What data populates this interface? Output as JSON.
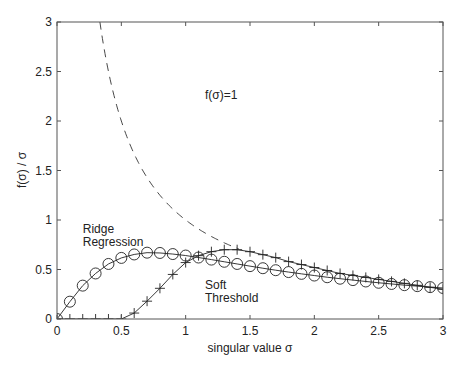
{
  "chart_data": {
    "type": "line",
    "title": "",
    "xlabel": "singular value σ",
    "ylabel": "f(σ) / σ",
    "xlim": [
      0,
      3
    ],
    "ylim": [
      0,
      3
    ],
    "xticks": [
      0,
      0.5,
      1,
      1.5,
      2,
      2.5,
      3
    ],
    "xtick_labels": [
      "0",
      "0.5",
      "1",
      "1.5",
      "2",
      "2.5",
      "3"
    ],
    "yticks": [
      0,
      0.5,
      1,
      1.5,
      2,
      2.5,
      3
    ],
    "ytick_labels": [
      "0",
      "0.5",
      "1",
      "1.5",
      "2",
      "2.5",
      "3"
    ],
    "grid": false,
    "legend": "none (inline annotations)",
    "annotations": [
      {
        "text": "f(σ)=1",
        "x": 1.15,
        "y": 2.22
      },
      {
        "text": "Ridge",
        "x": 0.2,
        "y": 0.87
      },
      {
        "text": "Regression",
        "x": 0.2,
        "y": 0.74
      },
      {
        "text": "Soft",
        "x": 1.15,
        "y": 0.3
      },
      {
        "text": "Threshold",
        "x": 1.15,
        "y": 0.17
      }
    ],
    "series": [
      {
        "name": "f(σ)=1",
        "style": "dashed",
        "marker": "none",
        "x": [
          0.333,
          0.4,
          0.5,
          0.6,
          0.7,
          0.8,
          0.9,
          1.0,
          1.1,
          1.2,
          1.3,
          1.4
        ],
        "values": [
          3.0,
          2.5,
          2.0,
          1.667,
          1.429,
          1.25,
          1.111,
          1.0,
          0.909,
          0.833,
          0.769,
          0.714
        ]
      },
      {
        "name": "Ridge Regression",
        "style": "solid",
        "marker": "circle",
        "x": [
          0,
          0.1,
          0.2,
          0.3,
          0.4,
          0.5,
          0.6,
          0.7,
          0.8,
          0.9,
          1.0,
          1.1,
          1.2,
          1.3,
          1.4,
          1.5,
          1.6,
          1.7,
          1.8,
          1.9,
          2.0,
          2.1,
          2.2,
          2.3,
          2.4,
          2.5,
          2.6,
          2.7,
          2.8,
          2.9,
          3.0
        ],
        "values": [
          0,
          0.175,
          0.337,
          0.46,
          0.556,
          0.617,
          0.652,
          0.67,
          0.667,
          0.656,
          0.641,
          0.621,
          0.6,
          0.578,
          0.556,
          0.534,
          0.513,
          0.493,
          0.474,
          0.456,
          0.439,
          0.422,
          0.407,
          0.393,
          0.379,
          0.366,
          0.354,
          0.342,
          0.332,
          0.322,
          0.313
        ]
      },
      {
        "name": "Soft Threshold",
        "style": "solid",
        "marker": "plus",
        "x": [
          0,
          0.1,
          0.2,
          0.3,
          0.4,
          0.5,
          0.6,
          0.7,
          0.8,
          0.9,
          1.0,
          1.1,
          1.2,
          1.3,
          1.4,
          1.5,
          1.6,
          1.7,
          1.8,
          1.9,
          2.0,
          2.1,
          2.2,
          2.3,
          2.4,
          2.5,
          2.6,
          2.7,
          2.8,
          2.9,
          3.0
        ],
        "values": [
          0,
          0,
          0,
          0,
          0,
          0,
          0.06,
          0.18,
          0.31,
          0.45,
          0.57,
          0.64,
          0.68,
          0.7,
          0.7,
          0.68,
          0.65,
          0.62,
          0.58,
          0.55,
          0.52,
          0.49,
          0.46,
          0.44,
          0.42,
          0.4,
          0.38,
          0.36,
          0.34,
          0.32,
          0.3
        ]
      }
    ]
  }
}
